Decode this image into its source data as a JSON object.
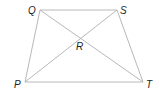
{
  "diagram": {
    "type": "trapezoid-with-diagonals",
    "line_color": "#b8b8b8",
    "label_color": "#222222",
    "points": {
      "Q": {
        "x": 40,
        "y": 10,
        "label": "Q",
        "lx": 28,
        "ly": 14
      },
      "S": {
        "x": 117,
        "y": 10,
        "label": "S",
        "lx": 120,
        "ly": 14
      },
      "P": {
        "x": 25,
        "y": 82,
        "label": "P",
        "lx": 14,
        "ly": 88
      },
      "T": {
        "x": 143,
        "y": 82,
        "label": "T",
        "lx": 146,
        "ly": 88
      },
      "R": {
        "x": 80,
        "y": 38,
        "label": "R",
        "lx": 76,
        "ly": 50
      }
    },
    "segments": [
      [
        "Q",
        "S"
      ],
      [
        "S",
        "T"
      ],
      [
        "T",
        "P"
      ],
      [
        "P",
        "Q"
      ],
      [
        "Q",
        "T"
      ],
      [
        "P",
        "S"
      ]
    ]
  }
}
